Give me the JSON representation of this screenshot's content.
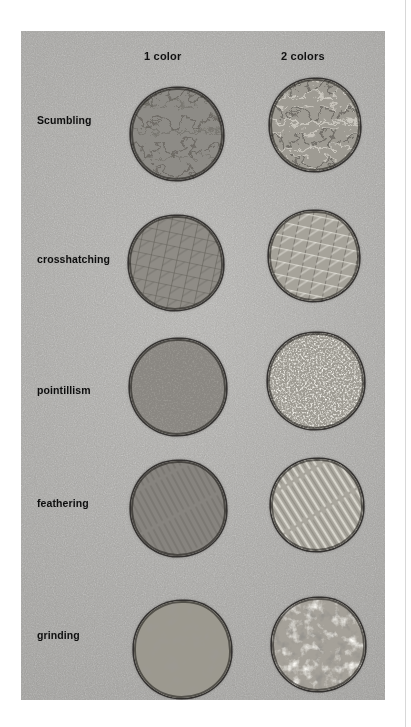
{
  "page": {
    "type": "scanned-photograph-figure",
    "background_color": "#ffffff",
    "rule_color": "#d8d8d8"
  },
  "figure": {
    "caption": "",
    "photo_background_color": "#a8a7a4",
    "column_headers": [
      {
        "id": "one-color",
        "label": "1 color"
      },
      {
        "id": "two-colors",
        "label": "2 colors"
      }
    ],
    "rows": [
      {
        "id": "scumbling",
        "label": "Scumbling",
        "samples": [
          {
            "column": "1 color",
            "texture": "scumbling",
            "tone": "#8d8b86",
            "description": "circular swatch with small scribbled loops in one colour"
          },
          {
            "column": "2 colors",
            "texture": "scumbling",
            "tone": "#9e9b93",
            "description": "circular swatch with scribbled loops in two colours, lighter highlights"
          }
        ]
      },
      {
        "id": "crosshatching",
        "label": "crosshatching",
        "samples": [
          {
            "column": "1 color",
            "texture": "crosshatching",
            "tone": "#8f8c86",
            "description": "circular swatch of crossed diagonal strokes in one colour"
          },
          {
            "column": "2 colors",
            "texture": "crosshatching",
            "tone": "#a6a39a",
            "description": "circular swatch of crossed diagonal strokes in two colours"
          }
        ]
      },
      {
        "id": "pointillism",
        "label": "pointillism",
        "samples": [
          {
            "column": "1 color",
            "texture": "pointillism",
            "tone": "#8a8782",
            "description": "circular swatch of dense small dots in one colour"
          },
          {
            "column": "2 colors",
            "texture": "pointillism",
            "tone": "#bdbab1",
            "description": "circular swatch of dense bright dots in two colours"
          }
        ]
      },
      {
        "id": "feathering",
        "label": "feathering",
        "samples": [
          {
            "column": "1 color",
            "texture": "feathering",
            "tone": "#87847f",
            "description": "circular swatch of fine parallel tapered strokes in one colour"
          },
          {
            "column": "2 colors",
            "texture": "feathering",
            "tone": "#a8a59c",
            "description": "circular swatch of fine parallel tapered strokes in two colours"
          }
        ]
      },
      {
        "id": "grinding",
        "label": "grinding",
        "samples": [
          {
            "column": "1 color",
            "texture": "grinding",
            "tone": "#97948d",
            "description": "circular swatch of mottled ground pigment in one colour"
          },
          {
            "column": "2 colors",
            "texture": "grinding",
            "tone": "#a5a199",
            "description": "circular swatch of mottled ground pigment in two colours with white flecks"
          }
        ]
      }
    ]
  }
}
